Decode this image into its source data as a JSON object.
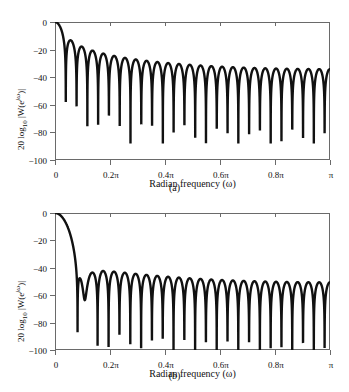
{
  "figure": {
    "panels": [
      {
        "id": "a",
        "caption": "(a)",
        "ylabel_prefix": "20 log",
        "ylabel_sub": "10",
        "ylabel_rest": " |W(e",
        "ylabel_exp": "jω",
        "ylabel_tail": ")|",
        "xlabel": "Radian frequency (ω)",
        "yticks": [
          "0",
          "−20",
          "−40",
          "−60",
          "−80",
          "−100"
        ],
        "xticks": [
          "0",
          "0.2π",
          "0.4π",
          "0.6π",
          "0.8π",
          "π"
        ]
      },
      {
        "id": "b",
        "caption": "(b)",
        "ylabel_prefix": "20 log",
        "ylabel_sub": "10",
        "ylabel_rest": " |W(e",
        "ylabel_exp": "jω",
        "ylabel_tail": ")|",
        "xlabel": "Radian frequency (ω)",
        "yticks": [
          "0",
          "−20",
          "−40",
          "−60",
          "−80",
          "−100"
        ],
        "xticks": [
          "0",
          "0.2π",
          "0.4π",
          "0.6π",
          "0.8π",
          "π"
        ]
      }
    ]
  },
  "chart_data": [
    {
      "type": "line",
      "panel": "a",
      "title": "(a)",
      "xlabel": "Radian frequency (ω)",
      "ylabel": "20 log10 |W(e^{jω})|",
      "xlim": [
        0,
        1
      ],
      "ylim": [
        -100,
        0
      ],
      "x_unit": "π radians",
      "xtick_values": [
        0,
        0.2,
        0.4,
        0.6,
        0.8,
        1.0
      ],
      "xtick_labels": [
        "0",
        "0.2π",
        "0.4π",
        "0.6π",
        "0.8π",
        "π"
      ],
      "ytick_values": [
        0,
        -20,
        -40,
        -60,
        -80,
        -100
      ],
      "ytick_labels": [
        "0",
        "−20",
        "−40",
        "−60",
        "−80",
        "−100"
      ],
      "grid": false,
      "legend": null,
      "window_type": "rectangular",
      "window_length_M": 50,
      "description": "Fourier transform magnitude (dB) of a rectangular window; main lobe at ω=0 falling to first null near 0.04π, followed by ~24 side lobes whose peaks decay from about −13 dB to about −36 dB at ω=π.",
      "mainlobe_peak_db": 0,
      "first_null_x": 0.04,
      "first_sidelobe_peak_db": -13,
      "sidelobe_peaks": [
        {
          "x": 0.06,
          "y": -13
        },
        {
          "x": 0.1,
          "y": -18
        },
        {
          "x": 0.14,
          "y": -21
        },
        {
          "x": 0.18,
          "y": -23
        },
        {
          "x": 0.22,
          "y": -25
        },
        {
          "x": 0.26,
          "y": -26
        },
        {
          "x": 0.3,
          "y": -27
        },
        {
          "x": 0.34,
          "y": -28
        },
        {
          "x": 0.38,
          "y": -29
        },
        {
          "x": 0.42,
          "y": -30
        },
        {
          "x": 0.46,
          "y": -31
        },
        {
          "x": 0.5,
          "y": -31
        },
        {
          "x": 0.54,
          "y": -32
        },
        {
          "x": 0.58,
          "y": -32
        },
        {
          "x": 0.62,
          "y": -33
        },
        {
          "x": 0.66,
          "y": -33
        },
        {
          "x": 0.7,
          "y": -34
        },
        {
          "x": 0.74,
          "y": -34
        },
        {
          "x": 0.78,
          "y": -34
        },
        {
          "x": 0.82,
          "y": -35
        },
        {
          "x": 0.86,
          "y": -35
        },
        {
          "x": 0.9,
          "y": -35
        },
        {
          "x": 0.94,
          "y": -36
        },
        {
          "x": 0.98,
          "y": -36
        }
      ],
      "notable_nulls": [
        {
          "x": 0.51,
          "y": -82
        },
        {
          "x": 0.96,
          "y": -80
        }
      ],
      "value_at_pi_db": -36
    },
    {
      "type": "line",
      "panel": "b",
      "title": "(b)",
      "xlabel": "Radian frequency (ω)",
      "ylabel": "20 log10 |W(e^{jω})|",
      "xlim": [
        0,
        1
      ],
      "ylim": [
        -100,
        0
      ],
      "x_unit": "π radians",
      "xtick_values": [
        0,
        0.2,
        0.4,
        0.6,
        0.8,
        1.0
      ],
      "xtick_labels": [
        "0",
        "0.2π",
        "0.4π",
        "0.6π",
        "0.8π",
        "π"
      ],
      "ytick_values": [
        0,
        -20,
        -40,
        -60,
        -80,
        -100
      ],
      "ytick_labels": [
        "0",
        "−20",
        "−40",
        "−60",
        "−80",
        "−100"
      ],
      "grid": false,
      "legend": null,
      "window_type": "Hamming",
      "window_length_M": 50,
      "description": "Fourier transform magnitude (dB) of a Hamming window; wider main lobe with first null near 0.08π, then ~12 side lobes with first peak about −26 dB decaying toward a floor near −55 dB.",
      "mainlobe_peak_db": 0,
      "first_null_x": 0.08,
      "first_sidelobe_peak_db": -26,
      "sidelobe_peaks": [
        {
          "x": 0.115,
          "y": -26
        },
        {
          "x": 0.195,
          "y": -35
        },
        {
          "x": 0.275,
          "y": -41
        },
        {
          "x": 0.355,
          "y": -45
        },
        {
          "x": 0.435,
          "y": -47
        },
        {
          "x": 0.515,
          "y": -49
        },
        {
          "x": 0.595,
          "y": -51
        },
        {
          "x": 0.675,
          "y": -52
        },
        {
          "x": 0.755,
          "y": -53
        },
        {
          "x": 0.835,
          "y": -54
        },
        {
          "x": 0.915,
          "y": -54
        },
        {
          "x": 0.995,
          "y": -55
        }
      ],
      "null_positions": [
        0.08,
        0.155,
        0.235,
        0.315,
        0.395,
        0.475,
        0.555,
        0.635,
        0.715,
        0.795,
        0.875,
        0.955
      ],
      "value_at_pi_db": -55
    }
  ]
}
